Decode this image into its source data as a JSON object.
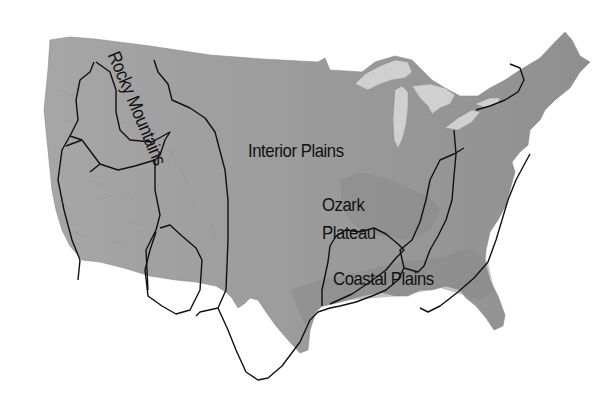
{
  "map": {
    "title": "Physical regions of the contiguous United States",
    "style": "grayscale shaded relief",
    "colors": {
      "background": "#ffffff",
      "land": "#9a9a9a",
      "land_west": "#a3a3a3",
      "plains_dark": "#8c8c8c",
      "water_lakes": "#cfcfcf",
      "boundary": "#111111"
    },
    "labels": {
      "rocky": "Rocky Mountains",
      "interior": "Interior Plains",
      "ozark_line1": "Ozark",
      "ozark_line2": "Plateau",
      "coastal": "Coastal Plains"
    }
  }
}
